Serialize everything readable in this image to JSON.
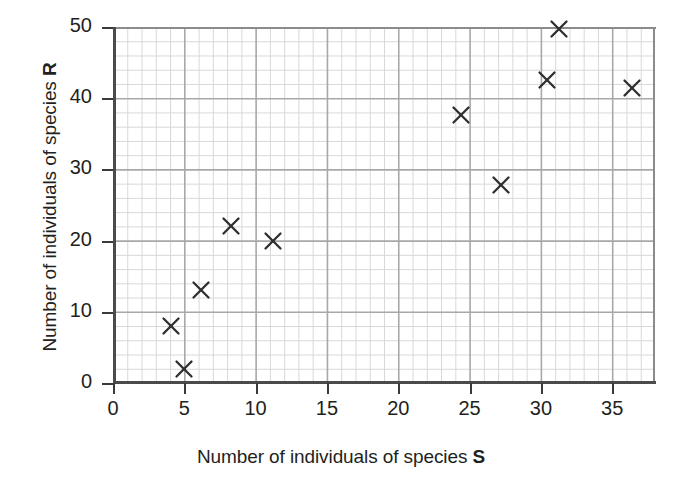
{
  "chart_data": {
    "type": "scatter",
    "title": "",
    "xlabel_prefix": "Number of individuals of species ",
    "xlabel_symbol": "S",
    "ylabel_prefix": "Number of individuals of species ",
    "ylabel_symbol": "R",
    "xlim": [
      0,
      38
    ],
    "ylim": [
      0,
      50
    ],
    "x_ticks": [
      0,
      5,
      10,
      15,
      20,
      25,
      30,
      35
    ],
    "x_tick_labels": [
      "0",
      "5",
      "10",
      "15",
      "20",
      "25",
      "30",
      "35"
    ],
    "y_ticks": [
      0,
      10,
      20,
      30,
      40,
      50
    ],
    "y_tick_labels": [
      "0",
      "10",
      "20",
      "30",
      "40",
      "50"
    ],
    "grid": true,
    "grid_minor_x_step": 1,
    "grid_minor_y_step": 2,
    "grid_major_x_step": 5,
    "grid_major_y_step": 10,
    "legend": null,
    "marker_style": "x",
    "marker_color": "#2f2f2f",
    "grid_minor_color": "#d8d8d8",
    "grid_major_color": "#a8a8a8",
    "axis_color": "#4b4b4b",
    "background_color": "#ffffff",
    "points": [
      {
        "x": 4.1,
        "y": 8.0
      },
      {
        "x": 5.0,
        "y": 2.0
      },
      {
        "x": 6.2,
        "y": 13.0
      },
      {
        "x": 8.3,
        "y": 22.0
      },
      {
        "x": 11.2,
        "y": 20.0
      },
      {
        "x": 24.4,
        "y": 37.6
      },
      {
        "x": 27.2,
        "y": 27.8
      },
      {
        "x": 30.4,
        "y": 42.5
      },
      {
        "x": 31.3,
        "y": 49.7
      },
      {
        "x": 36.4,
        "y": 41.4
      }
    ]
  }
}
